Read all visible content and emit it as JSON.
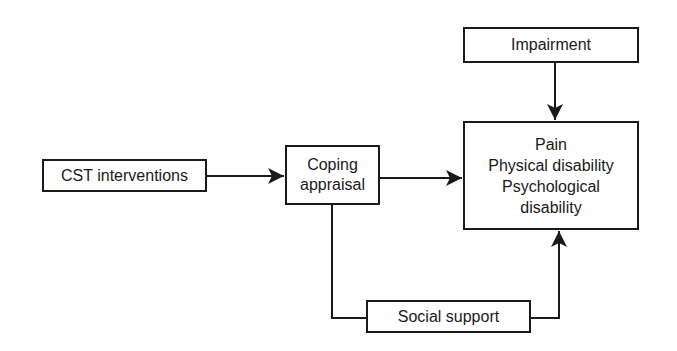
{
  "nodes": {
    "cst": {
      "label": "CST interventions"
    },
    "coping": {
      "lines": [
        "Coping",
        "appraisal"
      ]
    },
    "impairment": {
      "label": "Impairment"
    },
    "outcomes": {
      "lines": [
        "Pain",
        "Physical disability",
        "Psychological",
        "disability"
      ]
    },
    "social": {
      "label": "Social support"
    }
  },
  "edges": [
    {
      "from": "CST interventions",
      "to": "Coping appraisal"
    },
    {
      "from": "Coping appraisal",
      "to": "Outcomes"
    },
    {
      "from": "Impairment",
      "to": "Outcomes"
    },
    {
      "from": "Coping appraisal",
      "to": "Outcomes",
      "via": "Social support"
    }
  ],
  "colors": {
    "stroke": "#1a1a1a",
    "background": "#ffffff"
  }
}
